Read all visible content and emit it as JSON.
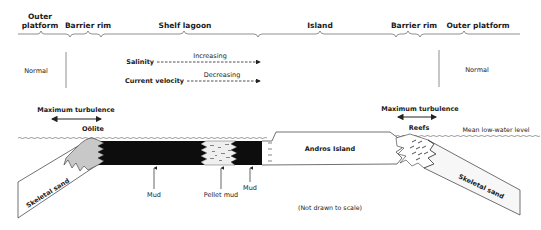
{
  "zones": [
    {
      "label_line1": "Outer",
      "label_line2": "platform"
    },
    {
      "label": "Barrier rim"
    },
    {
      "label": "Shelf lagoon"
    },
    {
      "label": "Island"
    },
    {
      "label": "Barrier rim"
    },
    {
      "label": "Outer platform"
    }
  ],
  "conditions": {
    "left_salinity": "Normal",
    "right_salinity": "Normal",
    "salinity_label": "Salinity",
    "salinity_trend": "Increasing",
    "current_label": "Current velocity",
    "current_trend": "Decreasing"
  },
  "turbulence": {
    "left": "Maximum turbulence",
    "right": "Maximum turbulence"
  },
  "facies": {
    "oolite": "Oölite",
    "reefs": "Reefs",
    "skeletal_sand_left": "Skeletal sand",
    "skeletal_sand_right": "Skeletal sand",
    "island": "Andros Island",
    "mud_1": "Mud",
    "pellet_mud": "Pellet mud",
    "mud_2": "Mud"
  },
  "water_level": "Mean low-water level",
  "note": "(Not drawn to scale)",
  "colors": {
    "mud": "#0d0d0d",
    "oolite": "#c8c8c8",
    "line": "#333333",
    "background": "#ffffff"
  }
}
